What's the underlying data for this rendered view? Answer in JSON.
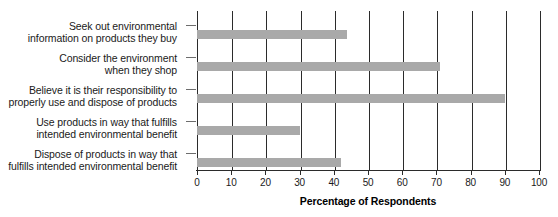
{
  "chart_data": {
    "type": "bar",
    "orientation": "horizontal",
    "title": "",
    "subtitle": "",
    "xlabel": "Percentage of Respondents",
    "ylabel": "",
    "xlim": [
      0,
      100
    ],
    "xticks": [
      0,
      10,
      20,
      30,
      40,
      50,
      60,
      70,
      80,
      90,
      100
    ],
    "xtick_labels": [
      "0",
      "10",
      "20",
      "30",
      "40",
      "50",
      "60",
      "70",
      "80",
      "90",
      "100"
    ],
    "grid": "vertical",
    "legend": "none",
    "bar_color": "#a9a9a9",
    "axis_color": "#2b2b2b",
    "categories": [
      "Seek out environmental information on products they buy",
      "Consider the environment when they shop",
      "Believe it is their responsibility to properly use and dispose of products",
      "Use products in way that fulfills intended environmental benefit",
      "Dispose of products in way that fulfills intended environmental benefit"
    ],
    "category_lines": [
      [
        "Seek out environmental",
        "information on products they buy"
      ],
      [
        "Consider the environment",
        "when they shop"
      ],
      [
        "Believe it is their responsibility to",
        "properly use and dispose of products"
      ],
      [
        "Use products in way that fulfills",
        "intended environmental benefit"
      ],
      [
        "Dispose of products in way that",
        "fulfills intended environmental benefit"
      ]
    ],
    "values": [
      44,
      71,
      90,
      30,
      42
    ]
  }
}
